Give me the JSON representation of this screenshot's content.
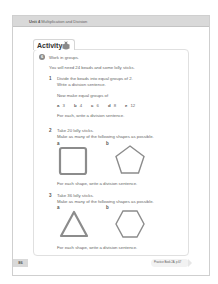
{
  "header": {
    "unit_label": "Unit 4",
    "unit_title": "Multiplication and Division"
  },
  "activity": {
    "title": "Activity",
    "icon": "beetle-icon",
    "number": "6",
    "intro": "Work in groups.",
    "materials": "You will need 24 beads and some lolly sticks.",
    "q1": {
      "number": "1",
      "line1": "Divide the beads into equal groups of 2.",
      "line2": "Write a division sentence.",
      "line3": "Now make equal groups of",
      "options": [
        {
          "label": "a",
          "value": "3"
        },
        {
          "label": "b",
          "value": "4"
        },
        {
          "label": "c",
          "value": "6"
        },
        {
          "label": "d",
          "value": "8"
        },
        {
          "label": "e",
          "value": "12"
        }
      ],
      "footer": "For each, write a division sentence."
    },
    "q2": {
      "number": "2",
      "line1": "Take 20 lolly sticks.",
      "line2": "Make as many of the following shapes as possible.",
      "shape_a_label": "a",
      "shape_a": "square",
      "shape_b_label": "b",
      "shape_b": "pentagon",
      "footer": "For each shape, write a division sentence."
    },
    "q3": {
      "number": "3",
      "line1": "Take 36 lolly sticks.",
      "line2": "Make as many of the following shapes as possible.",
      "shape_a_label": "a",
      "shape_a": "triangle",
      "shape_b_label": "b",
      "shape_b": "hexagon",
      "footer": "For each shape, write a division sentence."
    }
  },
  "footer": {
    "page_number": "86",
    "practice_ref": "Practice Book 2A, p.67"
  },
  "colors": {
    "header_band": "#d9d9d9",
    "border": "#cfcfcf",
    "shape_stroke": "#8c8c8c"
  }
}
